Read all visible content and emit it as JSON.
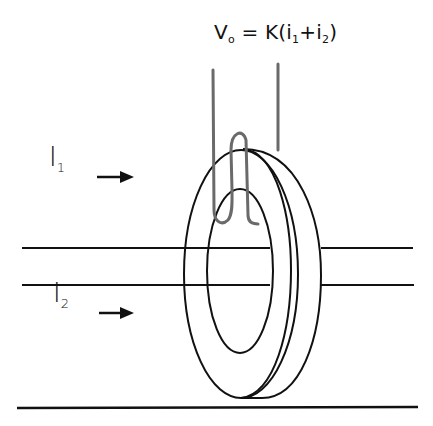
{
  "diagram": {
    "output_formula": {
      "lhs_symbol": "V",
      "lhs_sub": "o",
      "eq": " = K(",
      "term1_symbol": "i",
      "term1_sub": "1",
      "plus": "+",
      "term2_symbol": "i",
      "term2_sub": "2",
      "close": ")"
    },
    "inputs": [
      {
        "symbol": "I",
        "sub": "1",
        "arrow": "right-arrow"
      },
      {
        "symbol": "I",
        "sub": "2",
        "arrow": "right-arrow"
      }
    ],
    "components": [
      "toroidal-core",
      "secondary-winding",
      "primary-conductor-1",
      "primary-conductor-2",
      "ground-line"
    ],
    "colors": {
      "line": "#111111",
      "winding": "#6a6a6a",
      "background": "#ffffff"
    }
  }
}
